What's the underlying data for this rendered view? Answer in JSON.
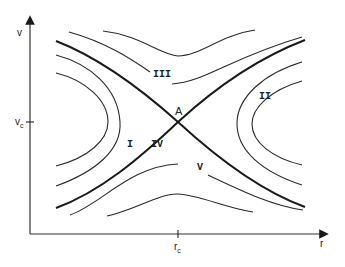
{
  "diagram": {
    "type": "phase-portrait",
    "axes": {
      "x_label": "r",
      "y_label": "v",
      "x_tick": {
        "base": "r",
        "sub": "c"
      },
      "y_tick": {
        "base": "v",
        "sub": "c"
      }
    },
    "critical_point": {
      "label": "A"
    },
    "regions": [
      {
        "id": "I",
        "label": "I"
      },
      {
        "id": "II",
        "label": "II"
      },
      {
        "id": "III",
        "label": "III"
      },
      {
        "id": "IV",
        "label": "IV"
      },
      {
        "id": "V",
        "label": "V"
      }
    ],
    "colors": {
      "line": "#1a1a1a",
      "background": "#ffffff"
    }
  }
}
